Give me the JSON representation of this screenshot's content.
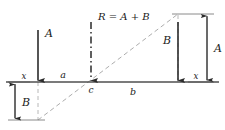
{
  "figure": {
    "colors": {
      "line": "#2b2b2b",
      "axis": "#555555",
      "construction": "#9a9a9a",
      "text": "#1a1a1a",
      "background": "#ffffff"
    },
    "axis": {
      "name": "x-x reference axis",
      "left_label": "x",
      "right_label": "x",
      "y": 82
    },
    "forces": [
      {
        "id": "A",
        "label": "A",
        "x": 38,
        "direction": "down",
        "tail_y": 30,
        "head_y": 82
      },
      {
        "id": "R",
        "label": "R = A + B",
        "x": 91,
        "direction": "down",
        "tail_y": 22,
        "head_y": 82,
        "style": "dash-dot"
      },
      {
        "id": "B",
        "label": "B",
        "x": 178,
        "direction": "down",
        "tail_y": 22,
        "head_y": 82
      }
    ],
    "point": {
      "label": "c",
      "x": 91,
      "y": 82
    },
    "segments": [
      {
        "label": "a",
        "from": 38,
        "to": 91,
        "side": "above"
      },
      {
        "label": "b",
        "from": 91,
        "to": 178,
        "side": "below"
      }
    ],
    "dimensions": [
      {
        "label": "B",
        "x": 15,
        "top": 82,
        "bottom": 120,
        "side": "left"
      },
      {
        "label": "A",
        "x": 207,
        "top": 14,
        "bottom": 82,
        "side": "right"
      }
    ],
    "construction_line": {
      "name": "diagonal-construction-line",
      "from_x": 38,
      "from_y": 120,
      "to_x": 178,
      "to_y": 14
    }
  }
}
